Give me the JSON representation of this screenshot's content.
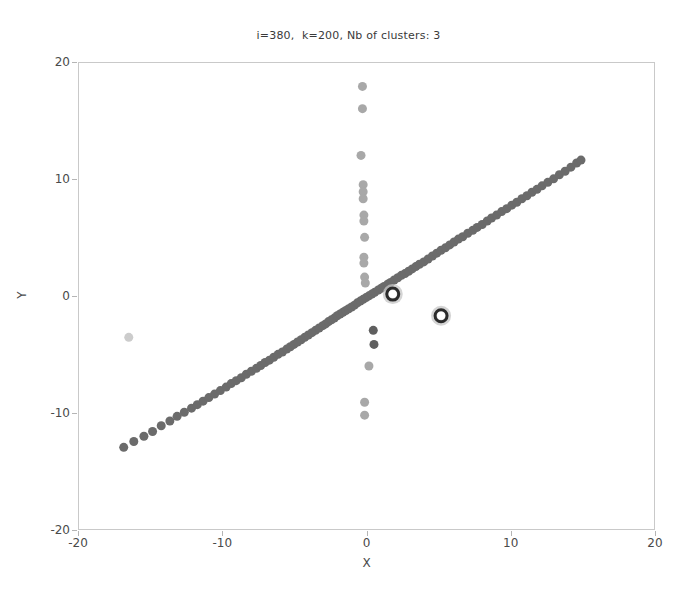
{
  "figure": {
    "width": 697,
    "height": 595,
    "background": "#ffffff"
  },
  "axes": {
    "frame_color": "#c9c9c9",
    "tick_color": "#4a4a4a",
    "left": 78,
    "top": 62,
    "width": 577,
    "height": 468
  },
  "chart_data": {
    "type": "scatter",
    "title": "i=380,  k=200, Nb of clusters: 3",
    "xlabel": "X",
    "ylabel": "Y",
    "xlim": [
      -20,
      20
    ],
    "ylim": [
      -20,
      20
    ],
    "xticks": [
      -20,
      -10,
      0,
      10,
      20
    ],
    "yticks": [
      -20,
      -10,
      0,
      10,
      20
    ],
    "xticklabels": [
      "-20",
      "-10",
      "0",
      "10",
      "20"
    ],
    "yticklabels": [
      "-20",
      "-10",
      "0",
      "10",
      "20"
    ],
    "grid": false,
    "legend": null,
    "marker_size": 9,
    "annotations": {
      "i": 380,
      "k": 200,
      "nb_of_clusters": 3
    },
    "series": [
      {
        "name": "diagonal-cluster",
        "color": "#6b6b6b",
        "marker": "o",
        "points": [
          [
            -16.9,
            -12.85
          ],
          [
            -16.2,
            -12.35
          ],
          [
            -15.5,
            -11.9
          ],
          [
            -14.9,
            -11.5
          ],
          [
            -14.3,
            -11.0
          ],
          [
            -13.7,
            -10.6
          ],
          [
            -13.2,
            -10.2
          ],
          [
            -12.7,
            -9.85
          ],
          [
            -12.2,
            -9.5
          ],
          [
            -11.8,
            -9.2
          ],
          [
            -11.4,
            -8.9
          ],
          [
            -11.0,
            -8.6
          ],
          [
            -10.6,
            -8.3
          ],
          [
            -10.2,
            -8.0
          ],
          [
            -9.8,
            -7.7
          ],
          [
            -9.45,
            -7.4
          ],
          [
            -9.1,
            -7.15
          ],
          [
            -8.75,
            -6.9
          ],
          [
            -8.4,
            -6.6
          ],
          [
            -8.05,
            -6.35
          ],
          [
            -7.7,
            -6.1
          ],
          [
            -7.4,
            -5.85
          ],
          [
            -7.1,
            -5.6
          ],
          [
            -6.8,
            -5.4
          ],
          [
            -6.5,
            -5.15
          ],
          [
            -6.2,
            -4.9
          ],
          [
            -5.9,
            -4.7
          ],
          [
            -5.6,
            -4.45
          ],
          [
            -5.35,
            -4.25
          ],
          [
            -5.1,
            -4.05
          ],
          [
            -4.85,
            -3.85
          ],
          [
            -4.6,
            -3.65
          ],
          [
            -4.35,
            -3.45
          ],
          [
            -4.1,
            -3.25
          ],
          [
            -3.85,
            -3.05
          ],
          [
            -3.6,
            -2.85
          ],
          [
            -3.35,
            -2.65
          ],
          [
            -3.1,
            -2.45
          ],
          [
            -2.9,
            -2.3
          ],
          [
            -2.7,
            -2.1
          ],
          [
            -2.5,
            -1.95
          ],
          [
            -2.3,
            -1.8
          ],
          [
            -2.1,
            -1.6
          ],
          [
            -1.9,
            -1.45
          ],
          [
            -1.7,
            -1.3
          ],
          [
            -1.5,
            -1.15
          ],
          [
            -1.3,
            -1.0
          ],
          [
            -1.1,
            -0.85
          ],
          [
            -0.9,
            -0.7
          ],
          [
            -0.7,
            -0.5
          ],
          [
            -0.5,
            -0.35
          ],
          [
            -0.3,
            -0.2
          ],
          [
            -0.1,
            -0.05
          ],
          [
            0.1,
            0.1
          ],
          [
            0.3,
            0.25
          ],
          [
            0.5,
            0.4
          ],
          [
            0.75,
            0.6
          ],
          [
            0.95,
            0.75
          ],
          [
            1.15,
            0.9
          ],
          [
            1.4,
            1.1
          ],
          [
            1.6,
            1.25
          ],
          [
            1.85,
            1.45
          ],
          [
            2.1,
            1.65
          ],
          [
            2.35,
            1.85
          ],
          [
            2.6,
            2.0
          ],
          [
            2.85,
            2.2
          ],
          [
            3.1,
            2.4
          ],
          [
            3.35,
            2.6
          ],
          [
            3.6,
            2.8
          ],
          [
            3.9,
            3.0
          ],
          [
            4.2,
            3.25
          ],
          [
            4.5,
            3.5
          ],
          [
            4.8,
            3.75
          ],
          [
            5.1,
            4.0
          ],
          [
            5.4,
            4.2
          ],
          [
            5.7,
            4.45
          ],
          [
            6.0,
            4.7
          ],
          [
            6.3,
            4.95
          ],
          [
            6.6,
            5.15
          ],
          [
            6.95,
            5.45
          ],
          [
            7.3,
            5.7
          ],
          [
            7.6,
            5.95
          ],
          [
            7.95,
            6.2
          ],
          [
            8.3,
            6.5
          ],
          [
            8.6,
            6.75
          ],
          [
            8.95,
            7.0
          ],
          [
            9.3,
            7.3
          ],
          [
            9.65,
            7.55
          ],
          [
            10.0,
            7.85
          ],
          [
            10.35,
            8.1
          ],
          [
            10.7,
            8.4
          ],
          [
            11.05,
            8.65
          ],
          [
            11.4,
            8.95
          ],
          [
            11.75,
            9.2
          ],
          [
            12.1,
            9.5
          ],
          [
            12.5,
            9.8
          ],
          [
            12.9,
            10.1
          ],
          [
            13.3,
            10.45
          ],
          [
            13.7,
            10.75
          ],
          [
            14.1,
            11.1
          ],
          [
            14.5,
            11.45
          ],
          [
            14.8,
            11.7
          ]
        ]
      },
      {
        "name": "vertical-cluster",
        "color": "#a8a8a8",
        "marker": "o",
        "points": [
          [
            -0.35,
            18.0
          ],
          [
            -0.35,
            16.1
          ],
          [
            -0.45,
            12.1
          ],
          [
            -0.3,
            9.6
          ],
          [
            -0.3,
            9.0
          ],
          [
            -0.3,
            8.4
          ],
          [
            -0.25,
            7.0
          ],
          [
            -0.25,
            6.5
          ],
          [
            -0.2,
            5.1
          ],
          [
            -0.25,
            3.4
          ],
          [
            -0.25,
            2.9
          ],
          [
            -0.2,
            1.7
          ],
          [
            -0.15,
            1.2
          ],
          [
            0.1,
            -5.9
          ],
          [
            -0.2,
            -9.0
          ],
          [
            -0.2,
            -10.1
          ]
        ]
      },
      {
        "name": "dark-outliers",
        "color": "#5f5f5f",
        "marker": "o",
        "points": [
          [
            0.4,
            -2.85
          ],
          [
            0.45,
            -4.05
          ]
        ]
      },
      {
        "name": "light-outlier",
        "color": "#cccccc",
        "marker": "o",
        "points": [
          [
            -16.55,
            -3.45
          ]
        ]
      },
      {
        "name": "centroids",
        "color": "#2b2b2b",
        "halo_color": "#c6c6c6",
        "marker": "ring",
        "points": [
          [
            1.75,
            0.25
          ],
          [
            5.1,
            -1.6
          ]
        ]
      }
    ]
  }
}
